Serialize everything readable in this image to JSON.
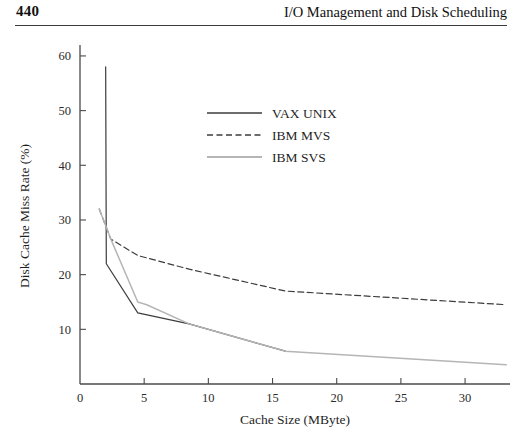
{
  "header": {
    "page_number": "440",
    "title": "I/O Management and Disk Scheduling"
  },
  "chart_data": {
    "type": "line",
    "title": "",
    "xlabel": "Cache Size (MByte)",
    "ylabel": "Disk Cache Miss Rate (%)",
    "xlim": [
      0,
      33.5
    ],
    "ylim": [
      0,
      62
    ],
    "xticks": [
      "0",
      "5",
      "10",
      "15",
      "20",
      "25",
      "30"
    ],
    "xtick_values": [
      0,
      5,
      10,
      15,
      20,
      25,
      30
    ],
    "yticks": [
      "10",
      "20",
      "30",
      "40",
      "50",
      "60"
    ],
    "ytick_values": [
      10,
      20,
      30,
      40,
      50,
      60
    ],
    "grid": false,
    "legend_position": "upper-center",
    "series": [
      {
        "name": "VAX UNIX",
        "style": "solid",
        "color": "#3c3c3c",
        "x": [
          2.0,
          2.05,
          4.5,
          8.5,
          16.0
        ],
        "y": [
          58.0,
          22.0,
          13.0,
          11.0,
          6.0
        ]
      },
      {
        "name": "IBM MVS",
        "style": "dashed",
        "color": "#3c3c3c",
        "x": [
          1.5,
          2.4,
          4.5,
          8.5,
          16.0,
          33.2
        ],
        "y": [
          32.0,
          26.5,
          23.5,
          21.0,
          17.0,
          14.5
        ]
      },
      {
        "name": "IBM SVS",
        "style": "solid",
        "color": "#b5b5b5",
        "x": [
          1.5,
          2.4,
          4.5,
          5.2,
          8.5,
          16.0,
          33.2
        ],
        "y": [
          32.0,
          26.5,
          15.0,
          14.5,
          11.0,
          6.0,
          3.5
        ]
      }
    ]
  }
}
